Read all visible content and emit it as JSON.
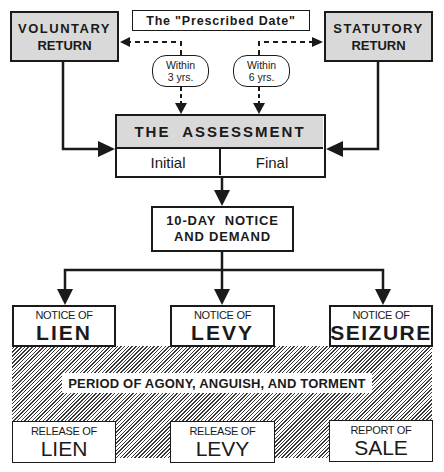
{
  "top": {
    "voluntary_return": {
      "line1": "VOLUNTARY",
      "line2": "RETURN"
    },
    "prescribed_date": "The \"Prescribed Date\"",
    "statutory_return": {
      "line1": "STATUTORY",
      "line2": "RETURN"
    }
  },
  "time_limits": [
    {
      "line1": "Within",
      "line2": "3 yrs."
    },
    {
      "line1": "Within",
      "line2": "6 yrs."
    }
  ],
  "assessment": {
    "title": "THE  ASSESSMENT",
    "initial": "Initial",
    "final": "Final"
  },
  "notice_demand": {
    "line1": "10-DAY  NOTICE",
    "line2": "AND DEMAND"
  },
  "notices": [
    {
      "prefix": "NOTICE OF",
      "label": "LIEN"
    },
    {
      "prefix": "NOTICE OF",
      "label": "LEVY"
    },
    {
      "prefix": "NOTICE OF",
      "label": "SEIZURE"
    }
  ],
  "period_label": "PERIOD OF AGONY, ANGUISH, AND TORMENT",
  "outcomes": [
    {
      "prefix": "RELEASE OF",
      "label": "LIEN"
    },
    {
      "prefix": "RELEASE OF",
      "label": "LEVY"
    },
    {
      "prefix": "REPORT OF",
      "label": "SALE"
    }
  ],
  "colors": {
    "line": "#1a1a1a",
    "shade": "#d9d9d9",
    "background": "#ffffff"
  }
}
